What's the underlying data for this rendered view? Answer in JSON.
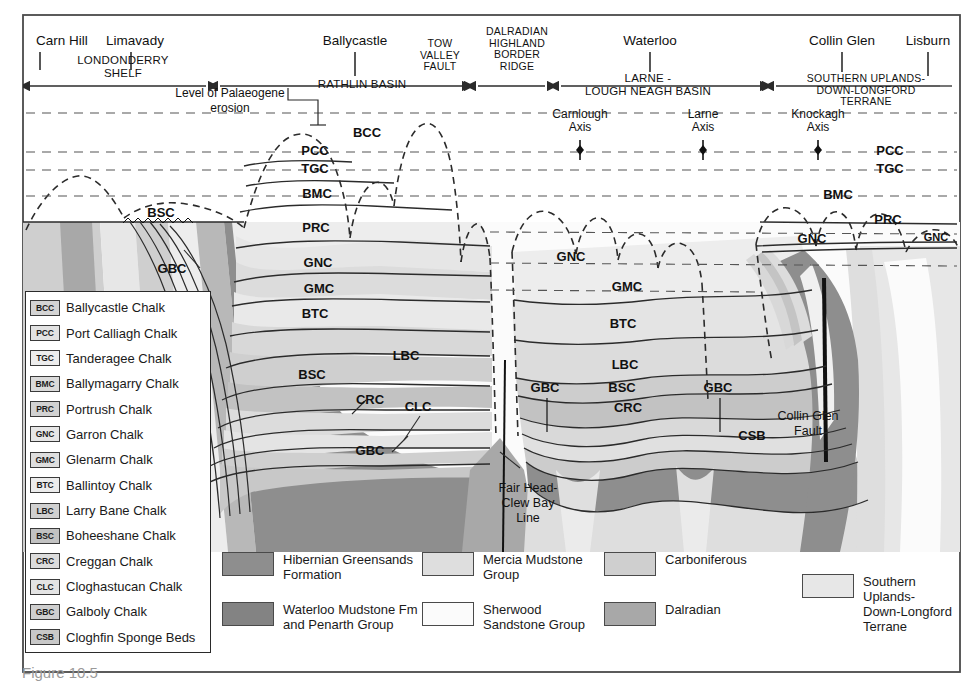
{
  "figure": {
    "caption": "Figure 10.5"
  },
  "header": {
    "places": [
      {
        "name": "Carn Hill",
        "x": 62
      },
      {
        "name": "Limavady",
        "x": 135
      },
      {
        "name": "Ballycastle",
        "x": 355
      },
      {
        "name": "Waterloo",
        "x": 650
      },
      {
        "name": "Collin Glen",
        "x": 842
      },
      {
        "name": "Lisburn",
        "x": 928
      }
    ],
    "regions": [
      {
        "label": "LONDONDERRY\nSHELF",
        "x": 123,
        "y": 64
      },
      {
        "label": "RATHLIN  BASIN",
        "x": 362,
        "y": 88
      },
      {
        "label": "TOW\nVALLEY\nFAULT",
        "x": 440,
        "y": 47
      },
      {
        "label": "DALRADIAN\nHIGHLAND\nBORDER\nRIDGE",
        "x": 517,
        "y": 35
      },
      {
        "label": "LARNE -\nLOUGH NEAGH BASIN",
        "x": 648,
        "y": 82
      },
      {
        "label": "SOUTHERN UPLANDS-\nDOWN-LONGFORD\nTERRANE",
        "x": 866,
        "y": 82
      }
    ],
    "erosion_note": "Level of Palaeogene\nerosion",
    "axes": [
      {
        "label": "Carnlough\nAxis",
        "x": 580,
        "y": 118
      },
      {
        "label": "Larne\nAxis",
        "x": 703,
        "y": 118
      },
      {
        "label": "Knockagh\nAxis",
        "x": 818,
        "y": 118
      }
    ]
  },
  "section": {
    "unit_labels": [
      {
        "text": "BCC",
        "x": 367,
        "y": 137,
        "size": "lg"
      },
      {
        "text": "PCC",
        "x": 315,
        "y": 155,
        "size": "lg"
      },
      {
        "text": "TGC",
        "x": 315,
        "y": 173,
        "size": "lg"
      },
      {
        "text": "BMC",
        "x": 317,
        "y": 198,
        "size": "lg"
      },
      {
        "text": "PRC",
        "x": 316,
        "y": 232,
        "size": "lg"
      },
      {
        "text": "GNC",
        "x": 318,
        "y": 267,
        "size": "lg"
      },
      {
        "text": "GMC",
        "x": 319,
        "y": 293,
        "size": "lg"
      },
      {
        "text": "BTC",
        "x": 315,
        "y": 318,
        "size": "lg"
      },
      {
        "text": "LBC",
        "x": 406,
        "y": 360,
        "size": "lg"
      },
      {
        "text": "BSC",
        "x": 312,
        "y": 379,
        "size": "lg"
      },
      {
        "text": "CRC",
        "x": 370,
        "y": 404,
        "size": "lg"
      },
      {
        "text": "CLC",
        "x": 418,
        "y": 411,
        "size": "lg"
      },
      {
        "text": "GBC",
        "x": 370,
        "y": 455,
        "size": "lg"
      },
      {
        "text": "BSC",
        "x": 161,
        "y": 217,
        "size": "lg"
      },
      {
        "text": "GBC",
        "x": 172,
        "y": 273,
        "size": "lg"
      },
      {
        "text": "GNC",
        "x": 571,
        "y": 261,
        "size": "lg"
      },
      {
        "text": "GMC",
        "x": 627,
        "y": 291,
        "size": "lg"
      },
      {
        "text": "BTC",
        "x": 623,
        "y": 328,
        "size": "lg"
      },
      {
        "text": "LBC",
        "x": 625,
        "y": 369,
        "size": "lg"
      },
      {
        "text": "BSC",
        "x": 622,
        "y": 392,
        "size": "lg"
      },
      {
        "text": "CRC",
        "x": 628,
        "y": 412,
        "size": "lg"
      },
      {
        "text": "GBC",
        "x": 545,
        "y": 392,
        "size": "lg"
      },
      {
        "text": "GBC",
        "x": 718,
        "y": 392,
        "size": "lg"
      },
      {
        "text": "CSB",
        "x": 752,
        "y": 440,
        "size": "lg"
      },
      {
        "text": "PCC",
        "x": 890,
        "y": 155,
        "size": "lg"
      },
      {
        "text": "TGC",
        "x": 890,
        "y": 173,
        "size": "lg"
      },
      {
        "text": "BMC",
        "x": 838,
        "y": 199,
        "size": "lg"
      },
      {
        "text": "PRC",
        "x": 888,
        "y": 224,
        "size": "lg"
      },
      {
        "text": "GNC",
        "x": 812,
        "y": 243,
        "size": "lg"
      },
      {
        "text": "GNC",
        "x": 936,
        "y": 241,
        "size": "sm"
      }
    ],
    "fault_labels": [
      {
        "text": "Fair Head-\nClew Bay\nLine",
        "x": 528,
        "y": 492
      },
      {
        "text": "Collin Glen\nFault",
        "x": 808,
        "y": 420
      }
    ]
  },
  "strat_legend": {
    "items": [
      {
        "code": "BCC",
        "name": "Ballycastle Chalk",
        "color": "#d4d4d4"
      },
      {
        "code": "PCC",
        "name": "Port Calliagh Chalk",
        "color": "#e2e2e2"
      },
      {
        "code": "TGC",
        "name": "Tanderagee Chalk",
        "color": "#ededed"
      },
      {
        "code": "BMC",
        "name": "Ballymagarry Chalk",
        "color": "#dadada"
      },
      {
        "code": "PRC",
        "name": "Portrush Chalk",
        "color": "#d2d2d2"
      },
      {
        "code": "GNC",
        "name": "Garron Chalk",
        "color": "#e6e6e6"
      },
      {
        "code": "GMC",
        "name": "Glenarm Chalk",
        "color": "#dedede"
      },
      {
        "code": "BTC",
        "name": "Ballintoy Chalk",
        "color": "#ececec"
      },
      {
        "code": "LBC",
        "name": "Larry Bane Chalk",
        "color": "#d0d0d0"
      },
      {
        "code": "BSC",
        "name": "Boheeshane Chalk",
        "color": "#c2c2c2"
      },
      {
        "code": "CRC",
        "name": "Creggan Chalk",
        "color": "#dcdcdc"
      },
      {
        "code": "CLC",
        "name": "Cloghastucan Chalk",
        "color": "#e4e4e4"
      },
      {
        "code": "GBC",
        "name": "Galboly Chalk",
        "color": "#cfcfcf"
      },
      {
        "code": "CSB",
        "name": "Cloghfin Sponge Beds",
        "color": "#c8c8c8"
      }
    ]
  },
  "rock_legend": {
    "items": [
      {
        "name": "Hibernian Greensands\nFormation",
        "color": "#8e8e8e",
        "x": 0,
        "y": 2
      },
      {
        "name": "Waterloo Mudstone Fm\nand Penarth Group",
        "color": "#838383",
        "x": 0,
        "y": 52
      },
      {
        "name": "Mercia Mudstone\nGroup",
        "color": "#dedede",
        "x": 200,
        "y": 2
      },
      {
        "name": "Sherwood\nSandstone Group",
        "color": "#fbfbfb",
        "x": 200,
        "y": 52
      },
      {
        "name": "Carboniferous",
        "color": "#cfcfcf",
        "x": 382,
        "y": 2
      },
      {
        "name": "Dalradian",
        "color": "#a8a8a8",
        "x": 382,
        "y": 52
      },
      {
        "name": "Southern Uplands-\nDown-Longford\nTerrane",
        "color": "#e7e7e7",
        "x": 580,
        "y": 24
      }
    ]
  },
  "colors": {
    "frame": "#4a4a4a",
    "chalk_light": "#ededed",
    "chalk_mid": "#dcdcdc",
    "chalk_dark": "#c9c9c9",
    "greensand": "#8e8e8e",
    "waterloo": "#838383",
    "mercia": "#dedede",
    "sherwood": "#fbfbfb",
    "carboniferous": "#cfcfcf",
    "dalradian": "#a8a8a8",
    "southern_uplands": "#e7e7e7",
    "line": "#2b2b2b"
  }
}
